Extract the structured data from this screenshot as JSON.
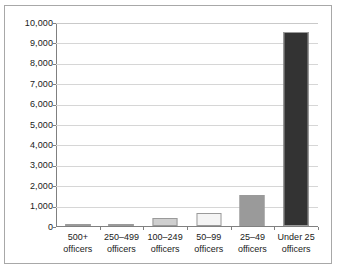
{
  "chart_data": {
    "type": "bar",
    "title": "",
    "subtitle": "",
    "xlabel": "",
    "ylabel": "",
    "ylim": [
      0,
      10000
    ],
    "y_tick_step": 1000,
    "grid": true,
    "legend": false,
    "categories": [
      "500+ officers",
      "250–499 officers",
      "100–249 officers",
      "50–99 officers",
      "25–49 officers",
      "Under 25 officers"
    ],
    "category_lines": [
      {
        "line1": "500+",
        "line2": "officers"
      },
      {
        "line1": "250–499",
        "line2": "officers"
      },
      {
        "line1": "100–249",
        "line2": "officers"
      },
      {
        "line1": "50–99",
        "line2": "officers"
      },
      {
        "line1": "25–49",
        "line2": "officers"
      },
      {
        "line1": "Under 25",
        "line2": "officers"
      }
    ],
    "values": [
      100,
      110,
      400,
      650,
      1500,
      9500
    ],
    "bar_colors": [
      "#5a5a5a",
      "#5a5a5a",
      "#cfcfcf",
      "#f4f4f4",
      "#9a9a9a",
      "#333333"
    ],
    "y_tick_labels": [
      "10,000",
      "9,000",
      "8,000",
      "7,000",
      "6,000",
      "5,000",
      "4,000",
      "3,000",
      "2,000",
      "1,000",
      "0"
    ],
    "y_tick_values": [
      10000,
      9000,
      8000,
      7000,
      6000,
      5000,
      4000,
      3000,
      2000,
      1000,
      0
    ]
  },
  "style": {
    "grid_color": "#d6d6d6",
    "axis_color": "#808080",
    "frame_color": "#a8a8a8",
    "text_color": "#1a1a1a",
    "background": "#ffffff"
  }
}
